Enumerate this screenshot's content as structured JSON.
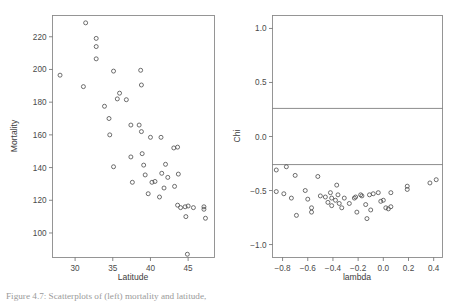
{
  "figure": {
    "caption": "Figure 4.7:  Scatterplots of (left) mortality and latitude,",
    "panel_count": 2
  },
  "chart_data": [
    {
      "type": "scatter",
      "panel": "left",
      "title": "",
      "xlabel": "Latitude",
      "ylabel": "Mortality",
      "xlim": [
        27.0,
        48.5
      ],
      "ylim": [
        85,
        233
      ],
      "xticks": [
        30,
        35,
        40,
        45
      ],
      "yticks": [
        100,
        120,
        140,
        160,
        180,
        200,
        220
      ],
      "grid": false,
      "legend": null,
      "marker": "open-circle",
      "points": [
        {
          "x": 28.0,
          "y": 196.5
        },
        {
          "x": 31.1,
          "y": 189.5
        },
        {
          "x": 31.4,
          "y": 228.5
        },
        {
          "x": 32.8,
          "y": 219.0
        },
        {
          "x": 32.8,
          "y": 214.0
        },
        {
          "x": 32.8,
          "y": 206.5
        },
        {
          "x": 33.9,
          "y": 177.5
        },
        {
          "x": 34.6,
          "y": 160.0
        },
        {
          "x": 34.5,
          "y": 170.0
        },
        {
          "x": 35.1,
          "y": 199.0
        },
        {
          "x": 35.1,
          "y": 140.5
        },
        {
          "x": 35.6,
          "y": 182.0
        },
        {
          "x": 35.9,
          "y": 185.5
        },
        {
          "x": 36.8,
          "y": 181.5
        },
        {
          "x": 37.4,
          "y": 166.0
        },
        {
          "x": 37.4,
          "y": 146.5
        },
        {
          "x": 37.6,
          "y": 131.0
        },
        {
          "x": 38.5,
          "y": 166.0
        },
        {
          "x": 38.7,
          "y": 199.5
        },
        {
          "x": 38.8,
          "y": 190.5
        },
        {
          "x": 38.8,
          "y": 162.0
        },
        {
          "x": 38.9,
          "y": 148.5
        },
        {
          "x": 39.1,
          "y": 141.5
        },
        {
          "x": 39.3,
          "y": 135.5
        },
        {
          "x": 39.7,
          "y": 124.0
        },
        {
          "x": 40.0,
          "y": 158.5
        },
        {
          "x": 40.2,
          "y": 131.0
        },
        {
          "x": 40.6,
          "y": 131.5
        },
        {
          "x": 41.2,
          "y": 122.0
        },
        {
          "x": 41.4,
          "y": 158.5
        },
        {
          "x": 41.5,
          "y": 136.5
        },
        {
          "x": 41.8,
          "y": 127.5
        },
        {
          "x": 42.0,
          "y": 142.0
        },
        {
          "x": 42.3,
          "y": 134.0
        },
        {
          "x": 43.1,
          "y": 152.0
        },
        {
          "x": 43.2,
          "y": 128.5
        },
        {
          "x": 43.6,
          "y": 152.5
        },
        {
          "x": 43.7,
          "y": 136.0
        },
        {
          "x": 43.6,
          "y": 117.0
        },
        {
          "x": 44.0,
          "y": 115.5
        },
        {
          "x": 44.6,
          "y": 116.0
        },
        {
          "x": 44.7,
          "y": 110.0
        },
        {
          "x": 45.0,
          "y": 116.5
        },
        {
          "x": 44.9,
          "y": 87.0
        },
        {
          "x": 45.7,
          "y": 115.5
        },
        {
          "x": 47.1,
          "y": 116.0
        },
        {
          "x": 47.1,
          "y": 114.5
        },
        {
          "x": 47.3,
          "y": 109.0
        }
      ]
    },
    {
      "type": "scatter",
      "panel": "right",
      "title": "",
      "xlabel": "lambda",
      "ylabel": "Chi",
      "xlim": [
        -0.88,
        0.47
      ],
      "ylim": [
        -1.12,
        1.12
      ],
      "xticks": [
        -0.8,
        -0.6,
        -0.4,
        -0.2,
        0.0,
        0.2,
        0.4
      ],
      "yticks": [
        -1.0,
        -0.5,
        0.0,
        0.5,
        1.0
      ],
      "grid": false,
      "legend": null,
      "marker": "open-circle",
      "reference_lines": [
        {
          "orientation": "horizontal",
          "y": 0.26
        },
        {
          "orientation": "horizontal",
          "y": -0.26
        }
      ],
      "points": [
        {
          "x": -0.85,
          "y": -0.31
        },
        {
          "x": -0.85,
          "y": -0.51
        },
        {
          "x": -0.77,
          "y": -0.28
        },
        {
          "x": -0.79,
          "y": -0.53
        },
        {
          "x": -0.73,
          "y": -0.57
        },
        {
          "x": -0.7,
          "y": -0.36
        },
        {
          "x": -0.69,
          "y": -0.73
        },
        {
          "x": -0.62,
          "y": -0.5
        },
        {
          "x": -0.6,
          "y": -0.58
        },
        {
          "x": -0.57,
          "y": -0.66
        },
        {
          "x": -0.57,
          "y": -0.7
        },
        {
          "x": -0.52,
          "y": -0.37
        },
        {
          "x": -0.5,
          "y": -0.55
        },
        {
          "x": -0.46,
          "y": -0.56
        },
        {
          "x": -0.44,
          "y": -0.61
        },
        {
          "x": -0.42,
          "y": -0.52
        },
        {
          "x": -0.41,
          "y": -0.57
        },
        {
          "x": -0.41,
          "y": -0.64
        },
        {
          "x": -0.38,
          "y": -0.59
        },
        {
          "x": -0.37,
          "y": -0.45
        },
        {
          "x": -0.36,
          "y": -0.54
        },
        {
          "x": -0.35,
          "y": -0.62
        },
        {
          "x": -0.33,
          "y": -0.66
        },
        {
          "x": -0.31,
          "y": -0.57
        },
        {
          "x": -0.27,
          "y": -0.62
        },
        {
          "x": -0.23,
          "y": -0.57
        },
        {
          "x": -0.22,
          "y": -0.56
        },
        {
          "x": -0.21,
          "y": -0.7
        },
        {
          "x": -0.18,
          "y": -0.54
        },
        {
          "x": -0.17,
          "y": -0.55
        },
        {
          "x": -0.14,
          "y": -0.63
        },
        {
          "x": -0.13,
          "y": -0.76
        },
        {
          "x": -0.11,
          "y": -0.54
        },
        {
          "x": -0.1,
          "y": -0.68
        },
        {
          "x": -0.08,
          "y": -0.53
        },
        {
          "x": -0.04,
          "y": -0.52
        },
        {
          "x": -0.02,
          "y": -0.6
        },
        {
          "x": 0.0,
          "y": -0.59
        },
        {
          "x": 0.02,
          "y": -0.66
        },
        {
          "x": 0.04,
          "y": -0.67
        },
        {
          "x": 0.06,
          "y": -0.52
        },
        {
          "x": 0.06,
          "y": -0.65
        },
        {
          "x": 0.19,
          "y": -0.46
        },
        {
          "x": 0.19,
          "y": -0.49
        },
        {
          "x": 0.37,
          "y": -0.43
        },
        {
          "x": 0.42,
          "y": -0.4
        }
      ]
    }
  ]
}
